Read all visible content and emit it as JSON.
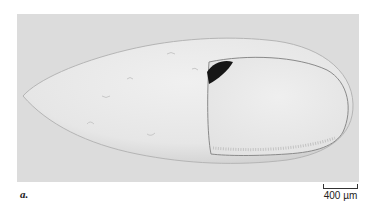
{
  "figure": {
    "panel_label": "a.",
    "scale_bar": {
      "label": "400 µm",
      "length_px": 35
    },
    "image": {
      "subject": "egg micrograph",
      "background_color": "#dcdcdc",
      "egg_color": "#ebebeb",
      "inner_chamber_color": "#e8e8e8",
      "dark_spot_color": "#1a1a1a"
    }
  }
}
